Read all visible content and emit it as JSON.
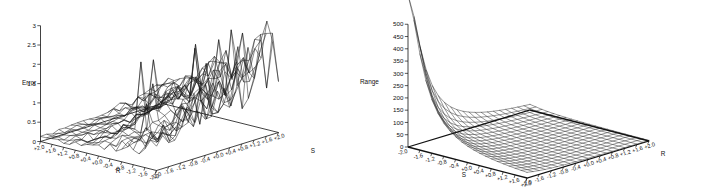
{
  "figure": {
    "background": "#ffffff",
    "ink_color": "#1a1a1a",
    "panel_count": 2
  },
  "chart_data": [
    {
      "type": "surface",
      "panel": "left",
      "title": "",
      "zlabel": "Error",
      "xlabel": "R",
      "ylabel": "S",
      "zticks": [
        "0",
        "0.5",
        "1",
        "1.5",
        "2",
        "2.5",
        "3"
      ],
      "zlim": [
        0,
        3
      ],
      "xticks": [
        "+2.0",
        "+1.6",
        "+1.2",
        "+0.8",
        "+0.4",
        "+0.0",
        "-0.4",
        "-0.8",
        "-1.2",
        "-1.6",
        "-2.0"
      ],
      "yticks": [
        "-2.0",
        "-1.6",
        "-1.2",
        "-0.8",
        "-0.4",
        "+0.0",
        "+0.4",
        "+0.8",
        "+1.2",
        "+1.6",
        "+2.0"
      ],
      "xlim": [
        2.0,
        -2.0
      ],
      "ylim": [
        -2.0,
        2.0
      ],
      "grid": false,
      "legend": false,
      "surface_character": "noisy jagged mesh, low near R=+2.0/S=-2.0 corner rising to ragged peaks near 2.5-2.8 at R=-2.0 / S=+2.0",
      "grid_steps": [
        21,
        21
      ],
      "values_note": "Error magnitude increases from ~0 at the front-left corner to ~2.5-2.8 with high-frequency noise at the rear-right corner"
    },
    {
      "type": "surface",
      "panel": "right",
      "title": "",
      "zlabel": "Range",
      "xlabel": "S",
      "ylabel": "R",
      "zticks": [
        "0",
        "50",
        "100",
        "150",
        "200",
        "250",
        "300",
        "350",
        "400",
        "450",
        "500"
      ],
      "zlim": [
        0,
        500
      ],
      "xticks": [
        "-2.0",
        "-1.6",
        "-1.2",
        "-0.8",
        "-0.4",
        "+0.0",
        "+0.4",
        "+0.8",
        "+1.2",
        "+1.6",
        "+2.0"
      ],
      "yticks": [
        "-2.0",
        "-1.6",
        "-1.2",
        "-0.8",
        "-0.4",
        "+0.0",
        "+0.4",
        "+0.8",
        "+1.2",
        "+1.6",
        "+2.0"
      ],
      "xlim": [
        -2.0,
        2.0
      ],
      "ylim": [
        -2.0,
        2.0
      ],
      "grid": false,
      "legend": false,
      "surface_character": "smooth monotonic decay; sharp spike above 500 at the S=-2.0 / R=-2.0 corner falling rapidly to near 0 across the rest of the domain",
      "grid_steps": [
        21,
        21
      ],
      "values_note": "Range peaks off-scale (>500) at the back-left corner and decays hyperbolically toward 0 along both S and R"
    }
  ],
  "panels": {
    "left": {
      "zlabel": "Error",
      "xlabel": "R",
      "ylabel": "S",
      "zticks": [
        "3",
        "2.5",
        "2",
        "1.5",
        "1",
        "0.5",
        "0"
      ],
      "xticks": [
        "+2.0",
        "+1.6",
        "+1.2",
        "+0.8",
        "+0.4",
        "+0.0",
        "-0.4",
        "-0.8",
        "-1.2",
        "-1.6",
        "-2.0"
      ],
      "yticks": [
        "-2.0",
        "-1.6",
        "-1.2",
        "-0.8",
        "-0.4",
        "+0.0",
        "+0.4",
        "+0.8",
        "+1.2",
        "+1.6",
        "+2.0"
      ]
    },
    "right": {
      "zlabel": "Range",
      "xlabel": "S",
      "ylabel": "R",
      "zticks": [
        "500",
        "450",
        "400",
        "350",
        "300",
        "250",
        "200",
        "150",
        "100",
        "50",
        "0"
      ],
      "corner_tick": "-2.0",
      "xticks": [
        "-1.6",
        "-1.2",
        "-0.8",
        "-0.4",
        "+0.0",
        "+0.4",
        "+0.8",
        "+1.2",
        "+1.6",
        "+2.0"
      ],
      "yticks": [
        "-2.0",
        "-1.6",
        "-1.2",
        "-0.8",
        "-0.4",
        "+0.0",
        "+0.4",
        "+0.8",
        "+1.2",
        "+1.6",
        "+2.0"
      ]
    }
  }
}
